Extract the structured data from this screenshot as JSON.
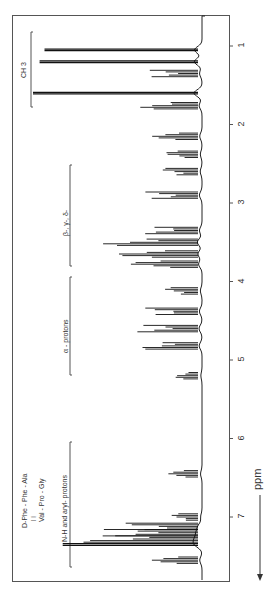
{
  "chart_data": {
    "type": "line",
    "title": "",
    "xlabel": "ppm",
    "ylabel": "",
    "orientation": "rotated-90 (ppm axis runs top-to-bottom, intensity leftwards)",
    "x_ticks": [
      "1",
      "2",
      "3",
      "4",
      "5",
      "6",
      "7"
    ],
    "xlim": [
      0.6,
      7.7
    ],
    "compound": {
      "line1": "D-Phe - Phe - Ala",
      "connector1": "|",
      "connector2": "|",
      "line2": "Val - Pro - Gly"
    },
    "regions": [
      {
        "label": "CH 3",
        "ppm_range": [
          0.65,
          1.7
        ]
      },
      {
        "label": "β-, γ-, δ-",
        "ppm_range": [
          2.5,
          3.8
        ]
      },
      {
        "label": "α - protons",
        "ppm_range": [
          3.95,
          5.2
        ]
      },
      {
        "label": "N-H and aryl- protons",
        "ppm_range": [
          6.0,
          7.5
        ]
      }
    ],
    "peaks": [
      {
        "ppm": 1.05,
        "intensity": 0.93
      },
      {
        "ppm": 1.2,
        "intensity": 0.96
      },
      {
        "ppm": 1.35,
        "intensity": 0.3
      },
      {
        "ppm": 1.6,
        "intensity": 1.0
      },
      {
        "ppm": 1.76,
        "intensity": 0.35
      },
      {
        "ppm": 2.15,
        "intensity": 0.28
      },
      {
        "ppm": 2.38,
        "intensity": 0.2
      },
      {
        "ppm": 2.6,
        "intensity": 0.22
      },
      {
        "ppm": 2.9,
        "intensity": 0.32
      },
      {
        "ppm": 3.35,
        "intensity": 0.32
      },
      {
        "ppm": 3.5,
        "intensity": 0.58
      },
      {
        "ppm": 3.65,
        "intensity": 0.5
      },
      {
        "ppm": 3.78,
        "intensity": 0.42
      },
      {
        "ppm": 4.12,
        "intensity": 0.2
      },
      {
        "ppm": 4.38,
        "intensity": 0.32
      },
      {
        "ppm": 4.6,
        "intensity": 0.37
      },
      {
        "ppm": 4.82,
        "intensity": 0.35
      },
      {
        "ppm": 5.2,
        "intensity": 0.14
      },
      {
        "ppm": 6.45,
        "intensity": 0.18
      },
      {
        "ppm": 7.0,
        "intensity": 0.16
      },
      {
        "ppm": 7.12,
        "intensity": 0.45
      },
      {
        "ppm": 7.2,
        "intensity": 0.6
      },
      {
        "ppm": 7.28,
        "intensity": 0.72
      },
      {
        "ppm": 7.35,
        "intensity": 0.82
      },
      {
        "ppm": 7.55,
        "intensity": 0.28
      }
    ],
    "grid": false,
    "legend": "none"
  },
  "labels": {
    "ch3": "CH 3",
    "beta": "β-, γ-, δ-",
    "alpha": "α - protons",
    "nh": "N-H and aryl- protons",
    "compound_line1": "D-Phe - Phe - Ala",
    "compound_bars": "|                  |",
    "compound_line2": "Val - Pro - Gly",
    "axis": "ppm",
    "ticks": [
      "1",
      "2",
      "3",
      "4",
      "5",
      "6",
      "7"
    ]
  }
}
